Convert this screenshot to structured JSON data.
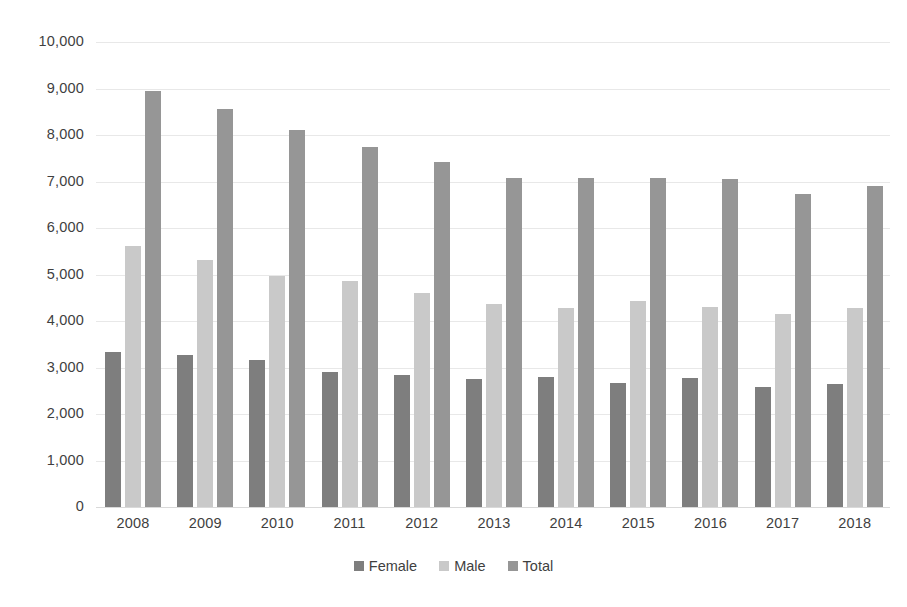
{
  "chart_data": {
    "type": "bar",
    "title": "",
    "subtitle": "",
    "xlabel": "",
    "ylabel": "",
    "categories": [
      "2008",
      "2009",
      "2010",
      "2011",
      "2012",
      "2013",
      "2014",
      "2015",
      "2016",
      "2017",
      "2018"
    ],
    "series": [
      {
        "name": "Female",
        "color": "#7e7e7e",
        "values": [
          3340,
          3260,
          3170,
          2900,
          2830,
          2750,
          2800,
          2670,
          2780,
          2590,
          2640
        ]
      },
      {
        "name": "Male",
        "color": "#c9c9c9",
        "values": [
          5620,
          5320,
          4960,
          4870,
          4600,
          4360,
          4290,
          4440,
          4300,
          4150,
          4270
        ]
      },
      {
        "name": "Total",
        "color": "#969696",
        "values": [
          8940,
          8560,
          8110,
          7750,
          7410,
          7080,
          7080,
          7080,
          7050,
          6740,
          6900
        ]
      }
    ],
    "ylim": [
      0,
      10000
    ],
    "ytick_step": 1000,
    "ytick_labels": [
      "10,000",
      "9,000",
      "8,000",
      "7,000",
      "6,000",
      "5,000",
      "4,000",
      "3,000",
      "2,000",
      "1,000",
      "0"
    ],
    "ytick_values": [
      10000,
      9000,
      8000,
      7000,
      6000,
      5000,
      4000,
      3000,
      2000,
      1000,
      0
    ],
    "grid": true,
    "grid_axis": "y",
    "legend_position": "bottom",
    "legend_entries": [
      "Female",
      "Male",
      "Total"
    ],
    "bar_width_px": 16,
    "background_color": "#ffffff",
    "text_color": "#3f3f3f",
    "gridline_color": "#e8e8e8"
  }
}
